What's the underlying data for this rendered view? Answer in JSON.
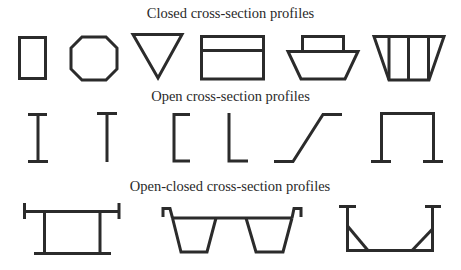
{
  "figure": {
    "sections": [
      {
        "title": "Closed cross-section profiles",
        "profiles": [
          "rectangle",
          "octagon",
          "inverted-triangle",
          "rectangle-with-divider",
          "trapezoid-with-box",
          "trapezoid-multi-cell"
        ]
      },
      {
        "title": "Open cross-section profiles",
        "profiles": [
          "I-section",
          "T-section",
          "channel-section",
          "L-section",
          "Z-section",
          "hat-section"
        ]
      },
      {
        "title": "Open-closed cross-section profiles",
        "profiles": [
          "box-girder-with-flanges",
          "double-trough-with-lips",
          "U-section-with-gussets"
        ]
      }
    ],
    "stroke_color": "#2b2b2b",
    "background": "#ffffff"
  }
}
